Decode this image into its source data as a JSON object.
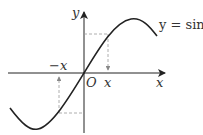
{
  "diagram": {
    "function_label": "y = sin x",
    "function_label_visible": "y = sin :",
    "axes": {
      "x_label": "x",
      "y_label": "y",
      "origin_label": "O"
    },
    "markers": {
      "pos_x_label": "x",
      "neg_x_label": "−x"
    },
    "colors": {
      "curve": "#222222",
      "axes": "#222222",
      "dashed": "#999999"
    }
  }
}
